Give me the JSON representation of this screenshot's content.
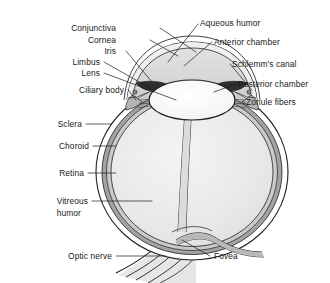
{
  "figure": {
    "type": "anatomical-diagram",
    "background_color": "#ffffff",
    "ink_color": "#1f1f1f",
    "label_color": "#1a1a1a"
  },
  "palette": {
    "sclera": "#ffffff",
    "choroid": "#9a9a9a",
    "retina": "#c9c9c9",
    "vitreous": "#ebebeb",
    "aqueous": "#d8d8d8",
    "lens": "#fbfbfb",
    "iris": "#3a3a3a",
    "ciliary": "#b0b0b0",
    "nerve": "#dcdcdc"
  },
  "labels": {
    "left_upper": [
      {
        "text": "Conjunctiva",
        "x": 116,
        "y": 31
      },
      {
        "text": "Cornea",
        "x": 116,
        "y": 43
      },
      {
        "text": "Iris",
        "x": 116,
        "y": 54
      },
      {
        "text": "Limbus",
        "x": 100,
        "y": 65
      },
      {
        "text": "Lens",
        "x": 100,
        "y": 76
      },
      {
        "text": "Ciliary body",
        "x": 88,
        "y": 93
      }
    ],
    "left_lower": [
      {
        "text": "Sclera",
        "x": 62,
        "y": 127
      },
      {
        "text": "Choroid",
        "x": 70,
        "y": 149
      },
      {
        "text": "Retina",
        "x": 64,
        "y": 176
      },
      {
        "text": "Vitreous",
        "x": 72,
        "y": 204
      },
      {
        "text": "humor",
        "x": 65,
        "y": 216
      },
      {
        "text": "Optic nerve",
        "x": 90,
        "y": 259
      }
    ],
    "right": [
      {
        "text": "Aqueous humor",
        "x": 200,
        "y": 26
      },
      {
        "text": "Anterior chamber",
        "x": 214,
        "y": 45
      },
      {
        "text": "Schlemm's canal",
        "x": 232,
        "y": 67
      },
      {
        "text": "Posterior chamber",
        "x": 238,
        "y": 87
      },
      {
        "text": "Zonule fibers",
        "x": 246,
        "y": 105
      },
      {
        "text": "Fovea",
        "x": 212,
        "y": 259
      }
    ]
  },
  "structures": [
    "sclera",
    "choroid",
    "retina",
    "vitreous humor",
    "cornea",
    "anterior chamber",
    "posterior chamber",
    "iris",
    "lens",
    "ciliary body",
    "zonule fibers",
    "Schlemm's canal",
    "limbus",
    "conjunctiva",
    "optic nerve",
    "fovea",
    "aqueous humor"
  ]
}
